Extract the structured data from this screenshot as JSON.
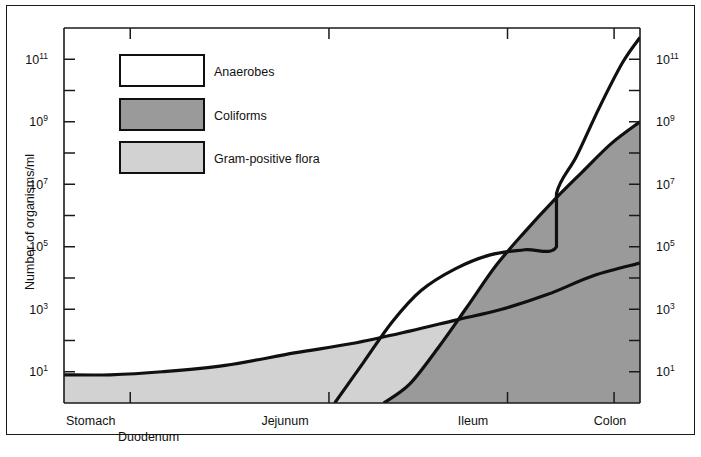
{
  "figure": {
    "border_color": "#1a1a1a",
    "background": "#ffffff"
  },
  "axes": {
    "y_title": "Number of organisms/ml",
    "y_ticks_labeled": [
      "10¹",
      "10³",
      "10⁵",
      "10⁷",
      "10⁹",
      "10¹¹"
    ],
    "y_tick_bases": [
      "10",
      "10",
      "10",
      "10",
      "10",
      "10"
    ],
    "y_tick_exponents": [
      "1",
      "3",
      "5",
      "7",
      "9",
      "11"
    ],
    "y_scale": "log",
    "y_min_exponent": 0,
    "y_max_exponent": 12,
    "y_labels_both_sides": true,
    "x_categories": [
      "Stomach",
      "Duodenum",
      "Jejunum",
      "Ileum",
      "Colon"
    ]
  },
  "legend": {
    "position": "top-left-inside",
    "items": [
      {
        "label": "Anaerobes",
        "color": "#ffffff"
      },
      {
        "label": "Coliforms",
        "color": "#9a9a9a"
      },
      {
        "label": "Gram-positive flora",
        "color": "#d2d2d2"
      }
    ]
  },
  "chart_data": {
    "type": "area",
    "title": "",
    "xlabel": "",
    "ylabel": "Number of organisms/ml",
    "x_type": "categorical-positional",
    "categories": [
      "Stomach",
      "Duodenum",
      "Jejunum",
      "Ileum",
      "Colon"
    ],
    "category_positions": [
      0.0,
      0.115,
      0.46,
      0.77,
      0.955
    ],
    "yscale": "log",
    "ylim": [
      1,
      1000000000000
    ],
    "grid": false,
    "legend_position": "upper left",
    "series": [
      {
        "name": "Gram-positive flora",
        "color": "#d2d2d2",
        "points": [
          {
            "x": 0.0,
            "y": 8
          },
          {
            "x": 0.08,
            "y": 8
          },
          {
            "x": 0.17,
            "y": 10
          },
          {
            "x": 0.28,
            "y": 16
          },
          {
            "x": 0.4,
            "y": 40
          },
          {
            "x": 0.5,
            "y": 80
          },
          {
            "x": 0.6,
            "y": 200
          },
          {
            "x": 0.68,
            "y": 450
          },
          {
            "x": 0.76,
            "y": 1000
          },
          {
            "x": 0.84,
            "y": 3000
          },
          {
            "x": 0.92,
            "y": 12000
          },
          {
            "x": 1.0,
            "y": 30000
          }
        ]
      },
      {
        "name": "Coliforms",
        "color": "#9a9a9a",
        "points": [
          {
            "x": 0.555,
            "y": 1
          },
          {
            "x": 0.6,
            "y": 4
          },
          {
            "x": 0.65,
            "y": 60
          },
          {
            "x": 0.7,
            "y": 1200
          },
          {
            "x": 0.75,
            "y": 25000
          },
          {
            "x": 0.8,
            "y": 300000
          },
          {
            "x": 0.85,
            "y": 3000000
          },
          {
            "x": 0.9,
            "y": 25000000
          },
          {
            "x": 0.95,
            "y": 200000000
          },
          {
            "x": 1.0,
            "y": 1000000000
          }
        ]
      },
      {
        "name": "Anaerobes",
        "color": "#ffffff",
        "has_discontinuity": true,
        "discontinuity_x": 0.855,
        "discontinuity_from": 100000,
        "discontinuity_to": 5000000,
        "points": [
          {
            "x": 0.47,
            "y": 1
          },
          {
            "x": 0.52,
            "y": 20
          },
          {
            "x": 0.57,
            "y": 400
          },
          {
            "x": 0.62,
            "y": 4000
          },
          {
            "x": 0.68,
            "y": 20000
          },
          {
            "x": 0.74,
            "y": 55000
          },
          {
            "x": 0.8,
            "y": 80000
          },
          {
            "x": 0.855,
            "y": 100000
          },
          {
            "x": 0.855,
            "y": 5000000
          },
          {
            "x": 0.89,
            "y": 80000000
          },
          {
            "x": 0.93,
            "y": 3000000000
          },
          {
            "x": 0.97,
            "y": 80000000000
          },
          {
            "x": 1.0,
            "y": 500000000000
          }
        ]
      }
    ]
  }
}
